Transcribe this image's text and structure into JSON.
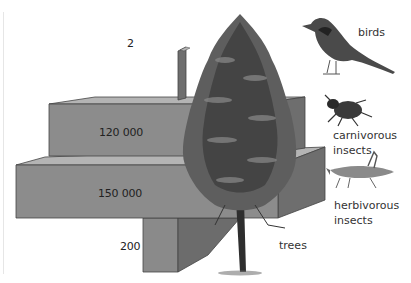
{
  "diagram": {
    "type": "pyramid_of_numbers",
    "levels": [
      {
        "organism": "birds",
        "count_label": "2",
        "value": 2,
        "icon": "bird-icon"
      },
      {
        "organism": "carnivorous insects",
        "count_label": "120 000",
        "value": 120000,
        "icon": "beetle-icon"
      },
      {
        "organism": "herbivorous insects",
        "count_label": "150 000",
        "value": 150000,
        "icon": "grasshopper-icon"
      },
      {
        "organism": "trees",
        "count_label": "200",
        "value": 200,
        "icon": "tree-icon"
      }
    ]
  },
  "labels": {
    "birds": "birds",
    "carnivorous_1": "carnivorous",
    "carnivorous_2": "insects",
    "herbivorous_1": "herbivorous",
    "herbivorous_2": "insects",
    "trees": "trees"
  },
  "numbers": {
    "birds": "2",
    "carnivorous": "120 000",
    "herbivorous": "150 000",
    "trees": "200"
  },
  "colors": {
    "front": "#8c8c8c",
    "top": "#b4b4b4",
    "side": "#6e6e6e",
    "tree_dark": "#3a3a3a",
    "tree_mid": "#6a6a6a"
  }
}
